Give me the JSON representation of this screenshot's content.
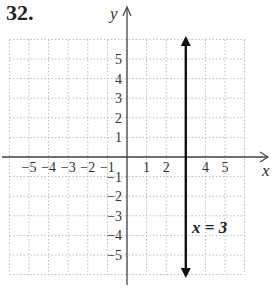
{
  "problem_number": "32.",
  "chart_data": {
    "type": "line",
    "title": "",
    "xlabel": "x",
    "ylabel": "y",
    "xlim": [
      -6,
      6
    ],
    "ylim": [
      -6,
      6
    ],
    "grid": true,
    "x_tick_labels": [
      "-5",
      "-4",
      "-3",
      "-2",
      "-1",
      "1",
      "2",
      "4",
      "5"
    ],
    "y_tick_labels": [
      "5",
      "4",
      "3",
      "2",
      "1",
      "-1",
      "-2",
      "-3",
      "-4",
      "-5"
    ],
    "series": [
      {
        "name": "x = 3",
        "x": [
          3,
          3
        ],
        "y": [
          -6,
          6
        ],
        "style": "vertical line with arrows"
      }
    ],
    "annotations": [
      {
        "text": "x = 3",
        "x": 4,
        "y": -3.5
      }
    ]
  }
}
